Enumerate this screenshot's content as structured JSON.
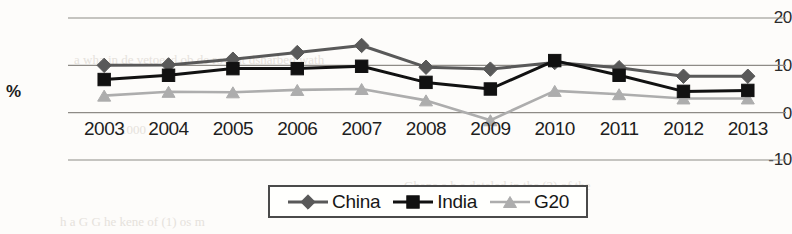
{
  "axis": {
    "ylabel": "%",
    "yticks": [
      "20",
      "10",
      "0",
      "-10"
    ],
    "ytick_values": [
      20,
      10,
      0,
      -10
    ]
  },
  "legend": {
    "entries": [
      {
        "label": "China",
        "marker": "diamond-marker-icon",
        "color": "#595959"
      },
      {
        "label": "India",
        "marker": "square-marker-icon",
        "color": "#111111"
      },
      {
        "label": "G20",
        "marker": "triangle-marker-icon",
        "color": "#adadad"
      }
    ]
  },
  "bleed_text": {
    "line1": "a wha in de vetoeed ob de rovent dsharbed wath",
    "line2": "1000",
    "line3": "China",
    "line4": "Ghana   a  h  a  deteled  in  the  (2) of  the",
    "line5": "h  a  G  G  he  kene  of  (1) os  m"
  },
  "chart_data": {
    "type": "line",
    "title": "",
    "xlabel": "",
    "ylabel": "%",
    "categories": [
      "2003",
      "2004",
      "2005",
      "2006",
      "2007",
      "2008",
      "2009",
      "2010",
      "2011",
      "2012",
      "2013"
    ],
    "ylim": [
      -10,
      20
    ],
    "yticks": [
      -10,
      0,
      10,
      20
    ],
    "grid": true,
    "legend_position": "bottom-center",
    "series": [
      {
        "name": "China",
        "marker": "diamond",
        "color": "#595959",
        "values": [
          10.0,
          10.1,
          11.3,
          12.7,
          14.2,
          9.6,
          9.2,
          10.6,
          9.5,
          7.7,
          7.7
        ]
      },
      {
        "name": "India",
        "marker": "square",
        "color": "#111111",
        "values": [
          7.0,
          7.9,
          9.3,
          9.3,
          9.8,
          6.4,
          5.0,
          11.0,
          7.9,
          4.5,
          4.7
        ]
      },
      {
        "name": "G20",
        "marker": "triangle",
        "color": "#adadad",
        "values": [
          3.6,
          4.4,
          4.3,
          4.8,
          5.0,
          2.6,
          -1.6,
          4.6,
          3.9,
          3.0,
          3.0
        ]
      }
    ]
  }
}
